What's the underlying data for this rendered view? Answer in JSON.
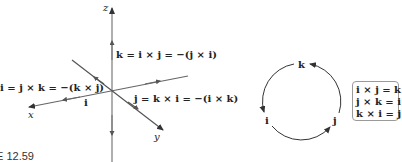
{
  "figure": {
    "caption": "E 12.59",
    "axes": {
      "x_label": "x",
      "y_label": "y",
      "z_label": "z"
    },
    "equations": {
      "k": "k = i × j = −(j × i)",
      "i": "i = j × k = −(k × j)",
      "j": "j = k × i = −(i × k)"
    },
    "vector_labels": {
      "i_on_axis": "i"
    },
    "cycle": {
      "nodes": [
        "k",
        "i",
        "j"
      ],
      "direction": "counterclockwise"
    },
    "rules_box": [
      "i × j = k",
      "j × k = i",
      "k × i = j"
    ]
  },
  "colors": {
    "axis": "#7a7a7a",
    "arrow": "#333333",
    "text": "#222222",
    "box_border": "#9a9a9a"
  }
}
